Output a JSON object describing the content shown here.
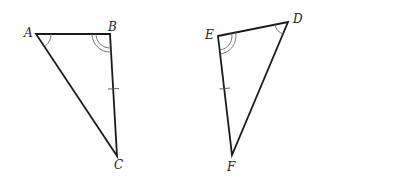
{
  "diagram": {
    "type": "congruent-triangles",
    "triangles": [
      {
        "name": "ABC",
        "vertices": [
          {
            "label": "A",
            "x": 36,
            "y": 34,
            "label_x": 24,
            "label_y": 32
          },
          {
            "label": "B",
            "x": 110,
            "y": 34,
            "label_x": 108,
            "label_y": 29
          },
          {
            "label": "C",
            "x": 117,
            "y": 156,
            "label_x": 114,
            "label_y": 168
          }
        ],
        "angle_marks": [
          {
            "vertex": "A",
            "arcs": 1
          },
          {
            "vertex": "B",
            "arcs": 2
          }
        ],
        "tick_marks": [
          {
            "side": "BC",
            "count": 1
          }
        ]
      },
      {
        "name": "DEF",
        "vertices": [
          {
            "label": "D",
            "x": 288,
            "y": 22,
            "label_x": 292,
            "label_y": 22
          },
          {
            "label": "E",
            "x": 218,
            "y": 36,
            "label_x": 205,
            "label_y": 38
          },
          {
            "label": "F",
            "x": 232,
            "y": 155,
            "label_x": 227,
            "label_y": 171
          }
        ],
        "angle_marks": [
          {
            "vertex": "D",
            "arcs": 1
          },
          {
            "vertex": "E",
            "arcs": 2
          }
        ],
        "tick_marks": [
          {
            "side": "EF",
            "count": 1
          }
        ]
      }
    ],
    "colors": {
      "line": "#1a1a1a",
      "mark": "#666666",
      "label": "#222222",
      "background": "#ffffff"
    }
  }
}
